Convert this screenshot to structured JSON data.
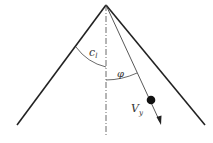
{
  "diagram": {
    "type": "cone-geometry",
    "labels": {
      "cone_angle": "c",
      "cone_angle_sub": "l",
      "ray_angle": "φ",
      "velocity": "V",
      "velocity_sub": "y"
    },
    "colors": {
      "stroke": "#222222",
      "background": "#ffffff"
    }
  }
}
